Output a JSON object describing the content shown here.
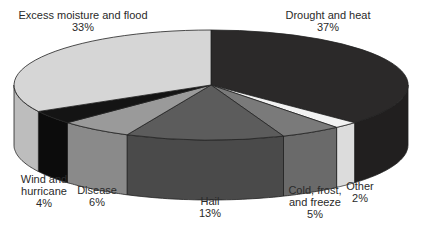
{
  "chart_data": {
    "type": "pie",
    "style": "3d",
    "title": "",
    "slices": [
      {
        "label": "Drought and heat",
        "value": 37,
        "color": "#2b2929",
        "side": "#211f1f"
      },
      {
        "label": "Other",
        "value": 2,
        "color": "#f2f2f2",
        "side": "#dcdcdc"
      },
      {
        "label": "Cold, frost, and freeze",
        "value": 5,
        "color": "#7a7a7a",
        "side": "#6a6a6a"
      },
      {
        "label": "Hail",
        "value": 13,
        "color": "#5c5c5c",
        "side": "#4a4a4a"
      },
      {
        "label": "Disease",
        "value": 6,
        "color": "#9a9a9a",
        "side": "#8a8a8a"
      },
      {
        "label": "Wind and hurricane",
        "value": 4,
        "color": "#141414",
        "side": "#0c0c0c"
      },
      {
        "label": "Excess moisture and flood",
        "value": 33,
        "color": "#d6d6d6",
        "side": "#bdbdbd"
      }
    ]
  },
  "labels": {
    "drought": {
      "line1": "Drought and heat",
      "pct": "37%"
    },
    "excess": {
      "line1": "Excess moisture and flood",
      "pct": "33%"
    },
    "wind": {
      "line1": "Wind and",
      "line2": "hurricane",
      "pct": "4%"
    },
    "disease": {
      "line1": "Disease",
      "pct": "6%"
    },
    "hail": {
      "line1": "Hail",
      "pct": "13%"
    },
    "cold": {
      "line1": "Cold, frost,",
      "line2": "and freeze",
      "pct": "5%"
    },
    "other": {
      "line1": "Other",
      "pct": "2%"
    }
  }
}
